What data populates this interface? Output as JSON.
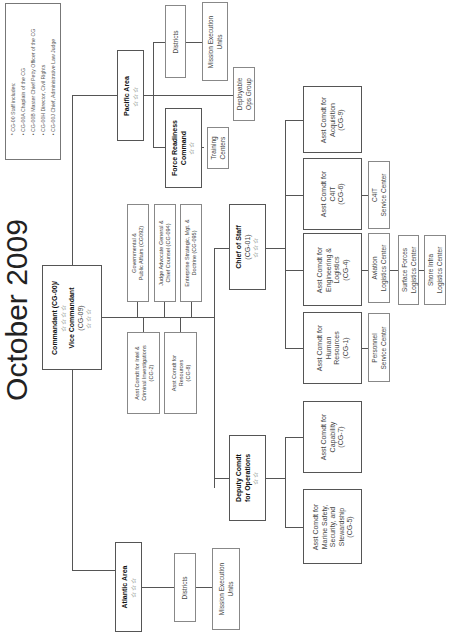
{
  "title": "October 2009",
  "note": {
    "heading": "* CG-00 Staff includes:",
    "items": [
      "• CG-00A Chaplain of the CG",
      "• CG-00B Master Chief Petty Officer of the CG",
      "• CG-00H Director, Civil Rights",
      "• CG-00J Chief, Administrative Law Judge"
    ]
  },
  "commandant": {
    "line1": "Commandant (CG-00)/",
    "stars1": "☆☆☆☆",
    "line2": "Vice Commandant",
    "line3": "(CG-09)",
    "stars2": "☆☆☆"
  },
  "staff": [
    {
      "line1": "Governmental &",
      "line2": "Public Affairs (CG092)"
    },
    {
      "line1": "Judge Advocate General &",
      "line2": "Chief Counsel (CG-094)"
    },
    {
      "line1": "Enterprise Strategic, Mgt. &",
      "line2": "Doctrine (CG-095)"
    },
    {
      "line1": "Asst Comdt for Intel &",
      "line2": "Criminal Investigations",
      "line3": "(CG-2)"
    },
    {
      "line1": "Asst Comdt for",
      "line2": "Resources",
      "line3": "(CG-8)"
    }
  ],
  "pacific": {
    "name": "Pacific Area",
    "stars": "☆☆☆",
    "districts": "Districts",
    "meu_line1": "Mission Execution",
    "meu_line2": "Units",
    "dog_line1": "Deployable",
    "dog_line2": "Ops Group"
  },
  "force_readiness": {
    "line1": "Force Readiness",
    "line2": "Command",
    "stars": "☆☆",
    "training_line1": "Training",
    "training_line2": "Centers"
  },
  "atlantic": {
    "name": "Atlantic Area",
    "stars": "☆☆☆",
    "districts": "Districts",
    "meu_line1": "Mission Execution",
    "meu_line2": "Units"
  },
  "chief_of_staff": {
    "line1": "Chief of Staff",
    "line2": "(CG-01)",
    "stars": "☆☆☆"
  },
  "deputy": {
    "line1": "Deputy Comdt",
    "line2": "for Operations",
    "stars": "☆☆"
  },
  "asst": {
    "acquisition": {
      "line1": "Asst Comdt for",
      "line2": "Acquisition",
      "line3": "(CG-9)"
    },
    "c4it": {
      "line1": "Asst Comdt for",
      "line2": "C4IT",
      "line3": "(CG-6)"
    },
    "eng": {
      "line1": "Asst Comdt for",
      "line2": "Engineering &",
      "line3": "Logistics",
      "line4": "(CG-4)"
    },
    "hr": {
      "line1": "Asst Comdt for",
      "line2": "Human",
      "line3": "Resources",
      "line4": "(CG-1)"
    },
    "capability": {
      "line1": "Asst Comdt for",
      "line2": "Capability",
      "line3": "(CG-7)"
    },
    "marine": {
      "line1": "Asst Comdt for",
      "line2": "Marine Safety,",
      "line3": "Security, and",
      "line4": "Stewardship",
      "line5": "(CG-5)"
    }
  },
  "centers": {
    "c4it_sc": {
      "line1": "C4IT",
      "line2": "Service Center"
    },
    "aviation": {
      "line1": "Aviation",
      "line2": "Logistics Center"
    },
    "surface": {
      "line1": "Surface Forces",
      "line2": "Logistics Center"
    },
    "shore": {
      "line1": "Shore Infra",
      "line2": "Logistics Center"
    },
    "personnel": {
      "line1": "Personnel",
      "line2": "Service Center"
    }
  }
}
